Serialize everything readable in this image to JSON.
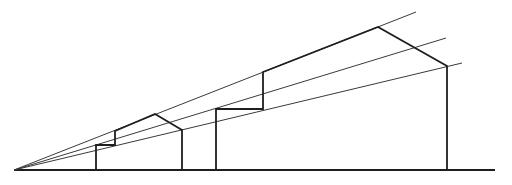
{
  "diagram": {
    "title": "",
    "type": "one-point perspective construction",
    "stroke_color": "#1e1e1e",
    "background": "#ffffff",
    "vanishing_point": [
      14,
      170
    ],
    "ground_line": {
      "x1": 14,
      "y1": 170,
      "x2": 495,
      "y2": 170
    },
    "rays": [
      {
        "name": "ray-top",
        "x1": 14,
        "y1": 170,
        "x2": 416,
        "y2": 12
      },
      {
        "name": "ray-middle",
        "x1": 14,
        "y1": 170,
        "x2": 446,
        "y2": 38
      },
      {
        "name": "ray-bottom",
        "x1": 14,
        "y1": 170,
        "x2": 462,
        "y2": 63
      }
    ],
    "shapes": [
      {
        "name": "small-house-outline",
        "points": "96,170 96,145 115,145 115,131 155,114 182,130 182,170"
      },
      {
        "name": "large-house-outline",
        "points": "216,170 216,109 263,109 263,72 378,27 447,66 447,170"
      }
    ]
  }
}
